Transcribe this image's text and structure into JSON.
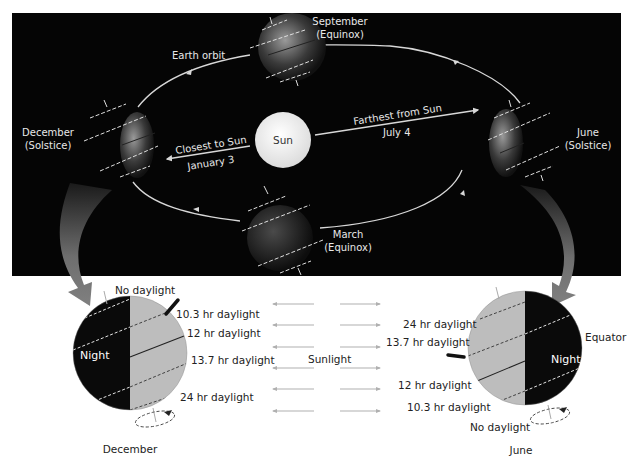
{
  "colors": {
    "panel": "#050505",
    "sun": "#f2f2f2",
    "orbit": "#d8d8d8",
    "day_side": "#bdbdbd",
    "night_side": "#0a0a0a",
    "sunlight_arrow": "#b0b0b0",
    "curved_arrow": "#7a7a7a"
  },
  "orbit_panel": {
    "sun_label": "Sun",
    "earth_orbit_label": "Earth orbit",
    "positions": {
      "september": {
        "month": "September",
        "event": "(Equinox)"
      },
      "december": {
        "month": "December",
        "event": "(Solstice)"
      },
      "june": {
        "month": "June",
        "event": "(Solstice)"
      },
      "march": {
        "month": "March",
        "event": "(Equinox)"
      }
    },
    "closest": {
      "label": "Closest to Sun",
      "date": "January 3"
    },
    "farthest": {
      "label": "Farthest from Sun",
      "date": "July 4"
    }
  },
  "december_globe": {
    "caption": "December",
    "night_label": "Night",
    "top_label": "No daylight",
    "latitudes": [
      {
        "label": "10.3 hr daylight"
      },
      {
        "label": "12 hr daylight"
      },
      {
        "label": "13.7 hr daylight"
      },
      {
        "label": "24 hr daylight"
      }
    ]
  },
  "june_globe": {
    "caption": "June",
    "night_label": "Night",
    "equator_label": "Equator",
    "bottom_label": "No daylight",
    "latitudes": [
      {
        "label": "24 hr daylight"
      },
      {
        "label": "13.7 hr daylight"
      },
      {
        "label": "12 hr daylight"
      },
      {
        "label": "10.3 hr daylight"
      }
    ]
  },
  "sunlight": {
    "label": "Sunlight",
    "arrow_rows": 6
  }
}
